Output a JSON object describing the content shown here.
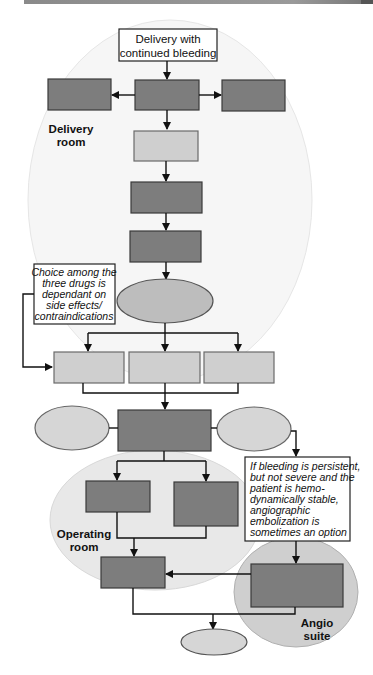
{
  "diagram": {
    "start": {
      "line1": "Delivery with",
      "line2": "continued bleeding"
    },
    "zones": {
      "delivery_room": {
        "line1": "Delivery",
        "line2": "room"
      },
      "operating_room": {
        "line1": "Operating",
        "line2": "room"
      },
      "angio_suite": {
        "line1": "Angio",
        "line2": "suite"
      }
    },
    "notes": {
      "drug_choice": [
        "Choice among the",
        "three drugs is",
        "dependant on",
        "side effects/",
        "contraindications"
      ],
      "angio": [
        "If bleeding is persistent,",
        "but not severe and the",
        "patient is hemo-",
        "dynamically stable,",
        "angiographic",
        "embolization is",
        "sometimes an option"
      ]
    },
    "colors": {
      "dark_box": "#7d7d7d",
      "light_box": "#cfcfcf",
      "zone_fill": "#ececec"
    }
  }
}
